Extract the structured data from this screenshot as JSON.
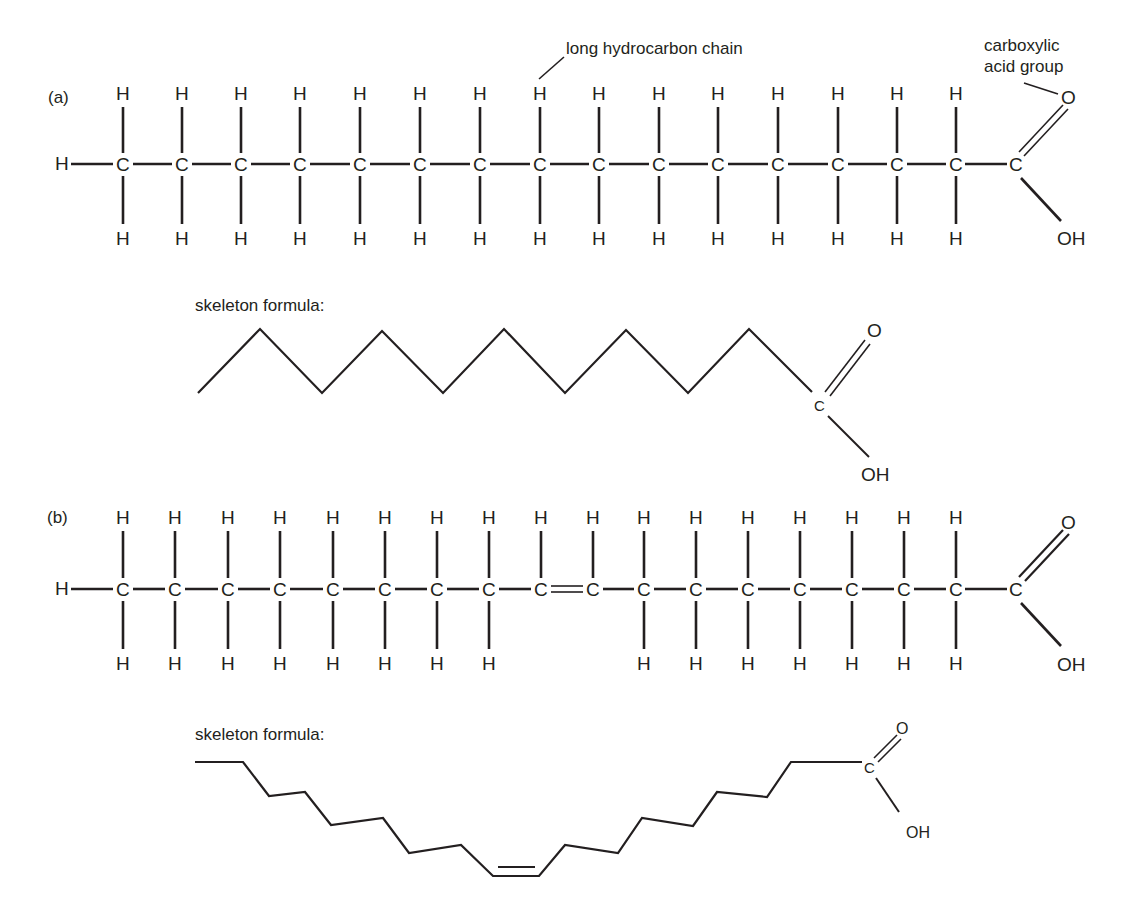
{
  "figure": {
    "part_a": {
      "label": "(a)",
      "atom_symbol_carbon": "C",
      "atom_symbol_hydrogen": "H",
      "terminal_h": "H",
      "carbons_x": [
        123,
        182,
        241,
        300,
        360,
        420,
        480,
        540,
        599,
        659,
        718,
        778,
        838,
        897,
        956
      ],
      "carbonyl_carbon": "C",
      "carbonyl_oxygen": "O",
      "hydroxyl": "OH",
      "annotation_chain": "long hydrocarbon chain",
      "annotation_acid_line1": "carboxylic",
      "annotation_acid_line2": "acid group",
      "skeleton_label": "skeleton formula:",
      "skeleton_carbon": "C",
      "skeleton_oxygen": "O",
      "skeleton_hydroxyl": "OH"
    },
    "part_b": {
      "label": "(b)",
      "atom_symbol_carbon": "C",
      "atom_symbol_hydrogen": "H",
      "terminal_h": "H",
      "carbons_x": [
        123,
        175,
        228,
        280,
        333,
        385,
        437,
        489,
        541,
        593,
        644,
        696,
        748,
        800,
        852,
        904,
        956
      ],
      "double_bond_between_index": [
        8,
        9
      ],
      "carbonyl_carbon": "C",
      "carbonyl_oxygen": "O",
      "hydroxyl": "OH",
      "skeleton_label": "skeleton formula:",
      "skeleton_carbon": "C",
      "skeleton_oxygen": "O",
      "skeleton_hydroxyl": "OH"
    },
    "colors": {
      "ink": "#231f20",
      "background": "#ffffff"
    }
  }
}
